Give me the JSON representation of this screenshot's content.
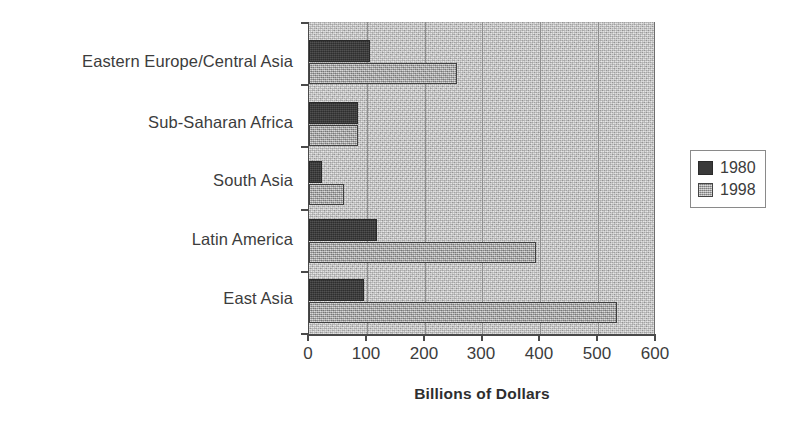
{
  "chart_data": {
    "type": "bar",
    "orientation": "horizontal",
    "title": "",
    "xlabel": "Billions of Dollars",
    "ylabel": "",
    "xlim": [
      0,
      600
    ],
    "xticks": [
      0,
      100,
      200,
      300,
      400,
      500,
      600
    ],
    "xtick_labels": [
      "0",
      "100",
      "200",
      "300",
      "400",
      "500",
      "600"
    ],
    "grid": "vertical",
    "legend_position": "right-outside",
    "categories": [
      "East Asia",
      "Latin America",
      "South Asia",
      "Sub-Saharan Africa",
      "Eastern Europe/Central Asia"
    ],
    "series": [
      {
        "name": "1980",
        "color": "#3a3a3a",
        "values": [
          95,
          117,
          22,
          85,
          106
        ]
      },
      {
        "name": "1998",
        "color": "#b4b4b4",
        "values": [
          533,
          393,
          60,
          84,
          256
        ]
      }
    ]
  },
  "legend": {
    "entries": [
      {
        "label": "1980"
      },
      {
        "label": "1998"
      }
    ]
  },
  "axis": {
    "x_title": "Billions of Dollars",
    "tick_labels": [
      "0",
      "100",
      "200",
      "300",
      "400",
      "500",
      "600"
    ]
  },
  "category_labels": [
    "Eastern Europe/Central Asia",
    "Sub-Saharan Africa",
    "South Asia",
    "Latin America",
    "East Asia"
  ]
}
